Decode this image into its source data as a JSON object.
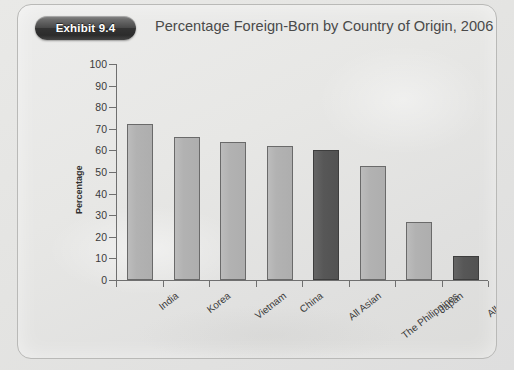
{
  "header": {
    "exhibit_badge": "Exhibit 9.4",
    "title": "Percentage Foreign-Born by Country of Origin, 2006"
  },
  "colors": {
    "bar_light": "#b2b2b2",
    "bar_dark": "#545454",
    "axis": "#6f6f6f",
    "text": "#3a3a3a",
    "page_background": "#e4e4e2"
  },
  "chart_data": {
    "type": "bar",
    "title": "Percentage Foreign-Born by Country of Origin, 2006",
    "xlabel": "",
    "ylabel": "Percentage",
    "ylim": [
      0,
      100
    ],
    "ytick_step": 10,
    "yticks": [
      0,
      10,
      20,
      30,
      40,
      50,
      60,
      70,
      80,
      90,
      100
    ],
    "grid": false,
    "legend": null,
    "categories": [
      "India",
      "Korea",
      "Vietnam",
      "China",
      "All Asian",
      "The Philippines",
      "Japan",
      "All U.S."
    ],
    "values": [
      72,
      66,
      64,
      62,
      60,
      53,
      27,
      11
    ],
    "bar_styles": [
      "light",
      "light",
      "light",
      "light",
      "dark",
      "light",
      "light",
      "dark"
    ]
  }
}
